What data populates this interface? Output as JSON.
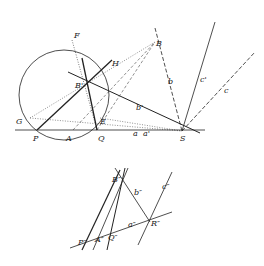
{
  "upper_figure": {
    "labels": {
      "F": "F",
      "H": "H",
      "B": "B",
      "Bp": "B'",
      "G": "G",
      "E": "E",
      "P": "P",
      "A": "A",
      "Q": "Q",
      "S": "S",
      "a": "a",
      "ap": "a'",
      "b": "b",
      "bp": "b'",
      "c": "c",
      "cp": "c'"
    }
  },
  "lower_figure": {
    "labels": {
      "B": "B″",
      "b": "b″",
      "c": "c″",
      "R": "R″",
      "a": "a″",
      "P": "P″",
      "A": "A″",
      "Q": "Q″"
    }
  }
}
